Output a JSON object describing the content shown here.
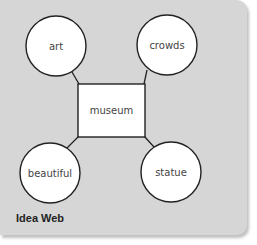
{
  "diagram": {
    "title": "Idea Web",
    "center": {
      "label": "museum"
    },
    "nodes": [
      {
        "label": "art"
      },
      {
        "label": "crowds"
      },
      {
        "label": "beautiful"
      },
      {
        "label": "statue"
      }
    ]
  },
  "colors": {
    "panel": "#d6d6d6",
    "node_fill": "#ffffff",
    "stroke": "#222222"
  }
}
